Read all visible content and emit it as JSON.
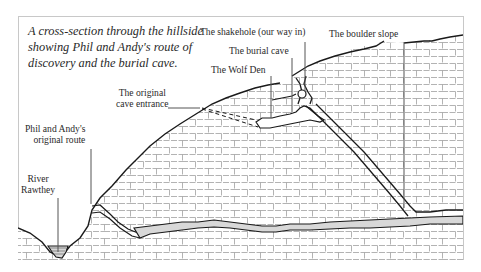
{
  "caption": {
    "lines": [
      "A cross-section through the hillside",
      "showing Phil and Andy's route of",
      "discovery and the burial cave."
    ]
  },
  "labels": {
    "shakehole": "The shakehole (our way in)",
    "burial_cave": "The burial cave",
    "wolf_den": "The Wolf Den",
    "boulder_slope": "The boulder slope",
    "original_entrance": [
      "The original",
      "cave entrance"
    ],
    "original_route": [
      "Phil and Andy's",
      "original route"
    ],
    "river": [
      "River",
      "Rawthey"
    ]
  },
  "colors": {
    "background": "#ffffff",
    "frame": "#c8c8c8",
    "ink": "#1a1a1a",
    "brick": "#9a9a9a",
    "leader": "#555555"
  }
}
